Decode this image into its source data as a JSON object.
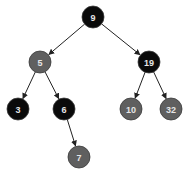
{
  "diagram": {
    "type": "red-black-tree",
    "colors": {
      "black": "#0a0a0a",
      "red": "#5f5f5f",
      "stroke": "#3a3a3a",
      "text": "#e6e6e6"
    },
    "nodes": [
      {
        "id": "n9",
        "label": "9",
        "color": "black",
        "x": 93,
        "y": 17
      },
      {
        "id": "n5",
        "label": "5",
        "color": "red",
        "x": 40,
        "y": 62
      },
      {
        "id": "n19",
        "label": "19",
        "color": "black",
        "x": 149,
        "y": 62
      },
      {
        "id": "n3",
        "label": "3",
        "color": "black",
        "x": 18,
        "y": 109
      },
      {
        "id": "n6",
        "label": "6",
        "color": "black",
        "x": 64,
        "y": 109
      },
      {
        "id": "n10",
        "label": "10",
        "color": "red",
        "x": 131,
        "y": 109
      },
      {
        "id": "n32",
        "label": "32",
        "color": "red",
        "x": 171,
        "y": 109
      },
      {
        "id": "n7",
        "label": "7",
        "color": "red",
        "x": 79,
        "y": 157
      }
    ],
    "edges": [
      {
        "from": "n9",
        "to": "n5"
      },
      {
        "from": "n9",
        "to": "n19"
      },
      {
        "from": "n5",
        "to": "n3"
      },
      {
        "from": "n5",
        "to": "n6"
      },
      {
        "from": "n19",
        "to": "n10"
      },
      {
        "from": "n19",
        "to": "n32"
      },
      {
        "from": "n6",
        "to": "n7"
      }
    ]
  }
}
